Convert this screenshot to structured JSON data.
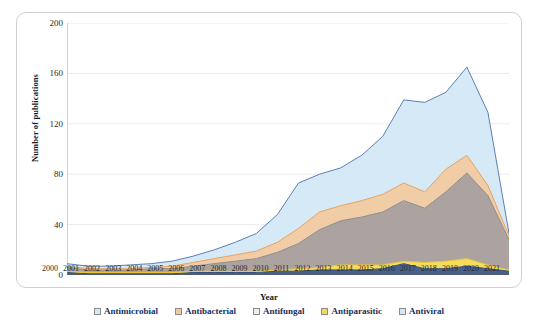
{
  "chart_data": {
    "type": "area",
    "stacked": true,
    "title": "",
    "subtitle": "",
    "xlabel": "Year",
    "ylabel": "Number of publications",
    "ylim": [
      0,
      200
    ],
    "yticks": [
      0,
      40,
      80,
      120,
      160,
      200
    ],
    "grid": true,
    "grid_axis": "y",
    "legend_position": "bottom",
    "categories": [
      "2000",
      "2001",
      "2002",
      "2003",
      "2004",
      "2005",
      "2006",
      "2007",
      "2008",
      "2009",
      "2010",
      "2011",
      "2012",
      "2013",
      "2014",
      "2015",
      "2016",
      "2017",
      "2018",
      "2019",
      "2020",
      "2021"
    ],
    "series": [
      {
        "name": "Antiviral",
        "color": "#2f4b7c",
        "fill": "#3b5382",
        "values": [
          2,
          1,
          1,
          1,
          1,
          1,
          2,
          2,
          2,
          2,
          3,
          3,
          4,
          4,
          4,
          5,
          9,
          5,
          5,
          7,
          5,
          3
        ]
      },
      {
        "name": "Antiparasitic",
        "color": "#e8c33a",
        "fill": "#f5d94e",
        "values": [
          1,
          1,
          1,
          1,
          1,
          1,
          1,
          1,
          1,
          1,
          1,
          2,
          2,
          4,
          4,
          3,
          2,
          5,
          6,
          6,
          3,
          1
        ]
      },
      {
        "name": "Antifungal",
        "color": "#8c8c8c",
        "fill": "#a59a98",
        "values": [
          3,
          2,
          2,
          2,
          3,
          3,
          4,
          6,
          8,
          10,
          14,
          20,
          30,
          35,
          38,
          42,
          48,
          43,
          55,
          68,
          55,
          24
        ]
      },
      {
        "name": "Antibacterial",
        "color": "#e8a15c",
        "fill": "#f0c9a0",
        "values": [
          1,
          1,
          1,
          1,
          1,
          2,
          3,
          4,
          5,
          6,
          8,
          12,
          14,
          12,
          13,
          14,
          14,
          13,
          18,
          14,
          8,
          3
        ]
      },
      {
        "name": "Antimicrobial",
        "color": "#5b7fb5",
        "fill": "#d3e7f5",
        "values": [
          2,
          2,
          2,
          3,
          3,
          4,
          5,
          7,
          10,
          14,
          22,
          36,
          30,
          30,
          36,
          46,
          66,
          71,
          61,
          70,
          58,
          2
        ]
      }
    ],
    "totals": [
      9,
      7,
      7,
      8,
      9,
      11,
      15,
      20,
      26,
      33,
      48,
      73,
      80,
      85,
      95,
      110,
      139,
      137,
      145,
      165,
      129,
      33
    ]
  },
  "legend": {
    "items": [
      {
        "label": "Antimicrobial",
        "color": "#d3e7f5"
      },
      {
        "label": "Antibacterial",
        "color": "#f0c9a0"
      },
      {
        "label": "Antifungal",
        "color": "#efeeec"
      },
      {
        "label": "Antiparasitic",
        "color": "#f5d94e"
      },
      {
        "label": "Antiviral",
        "color": "#d3e7f5"
      }
    ]
  }
}
